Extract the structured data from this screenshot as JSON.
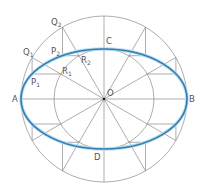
{
  "diagram": {
    "center": {
      "x": 104,
      "y": 99
    },
    "outer_radius": 83,
    "inner_radius": 50,
    "ellipse": {
      "rx": 83,
      "ry": 50
    },
    "radial_angles_deg": [
      0,
      30,
      60,
      90,
      120,
      150,
      180,
      210,
      240,
      270,
      300,
      330
    ],
    "colors": {
      "construction_line": "#8a8a8a",
      "ellipse": "#2f7db3",
      "ellipse_glow": "#bcdcef",
      "label": "#555555",
      "center_dot": "#222222"
    },
    "labels": {
      "A": "A",
      "B": "B",
      "C": "C",
      "D": "D",
      "O": "O",
      "Q1": {
        "main": "Q",
        "sub": "1"
      },
      "Q2": {
        "main": "Q",
        "sub": "2"
      },
      "P1": {
        "main": "P",
        "sub": "1"
      },
      "P2": {
        "main": "P",
        "sub": "2"
      },
      "R1": {
        "main": "R",
        "sub": "1"
      },
      "R2": {
        "main": "R",
        "sub": "2"
      }
    }
  }
}
